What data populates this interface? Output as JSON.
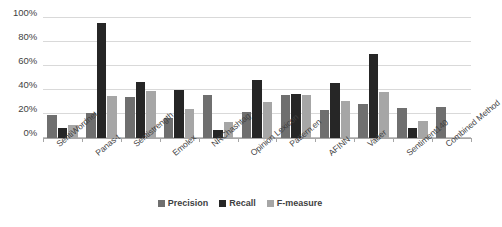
{
  "chart_data": {
    "type": "bar",
    "title": "",
    "subtitle": "",
    "xlabel": "",
    "ylabel": "",
    "ylim": [
      0,
      100
    ],
    "y_tick_labels": [
      "0%",
      "20%",
      "40%",
      "60%",
      "80%",
      "100%"
    ],
    "y_ticks": [
      0,
      20,
      40,
      60,
      80,
      100
    ],
    "grid": true,
    "legend_position": "bottom",
    "categories": [
      "SentiWordnet",
      "Panas-t",
      "Sentistrength",
      "Emolex",
      "NRChashtag",
      "Opinion Lexicon",
      "Pattern.en",
      "AFINN",
      "Vader",
      "Sentiment140",
      "Combined Method"
    ],
    "series": [
      {
        "name": "Precision",
        "color": "#6f6f6f",
        "values": [
          19,
          21,
          34,
          17,
          36,
          22,
          36,
          23,
          28,
          25,
          26
        ]
      },
      {
        "name": "Recall",
        "color": "#262626",
        "values": [
          8,
          96,
          47,
          40,
          7,
          48,
          37,
          46,
          70,
          8,
          0
        ]
      },
      {
        "name": "F-measure",
        "color": "#a6a6a6",
        "values": [
          11,
          35,
          39,
          24,
          13,
          30,
          36,
          31,
          38,
          14,
          0
        ]
      }
    ]
  },
  "legend": {
    "items": [
      {
        "label": "Precision"
      },
      {
        "label": "Recall"
      },
      {
        "label": "F-measure"
      }
    ]
  },
  "colors": {
    "precision": "#6f6f6f",
    "recall": "#262626",
    "fmeasure": "#a6a6a6",
    "gridline": "#d9d9d9",
    "axis": "#a6a6a6",
    "text": "#3f3f3f",
    "background": "#ffffff"
  }
}
